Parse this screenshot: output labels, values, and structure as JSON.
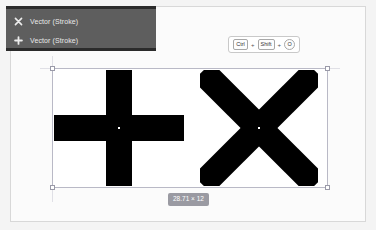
{
  "app": {
    "background_color": "#f4f4f4",
    "canvas_color": "#fbfbfb",
    "artboard_color": "#ffffff"
  },
  "layer_panel": {
    "background_color": "#5e5e5e",
    "items": [
      {
        "icon": "x-cross-icon",
        "label": "Vector (Stroke)"
      },
      {
        "icon": "plus-icon",
        "label": "Vector (Stroke)"
      }
    ]
  },
  "shortcut_badge": {
    "name": "keyboard-shortcut-hint",
    "keys": [
      "Ctrl",
      "Shift",
      "O"
    ],
    "separator": "+"
  },
  "selection": {
    "border_color": "#b9b9c6",
    "handle_color": "#ffffff",
    "dimension_label": "28.71 × 12"
  },
  "shapes": [
    {
      "name": "plus-shape",
      "fill": "#000000",
      "center_marker": "anchor-dot"
    },
    {
      "name": "x-shape",
      "fill": "#000000",
      "center_marker": "anchor-dot"
    }
  ]
}
